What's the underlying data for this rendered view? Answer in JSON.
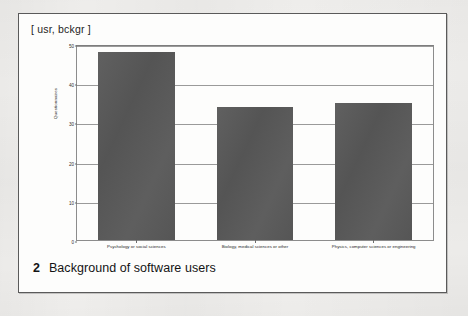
{
  "page": {
    "header_label": "[ usr, bckgr ]"
  },
  "caption": {
    "number": "2",
    "text": "Background of software users"
  },
  "chart_data": {
    "type": "bar",
    "title": "",
    "xlabel": "",
    "ylabel": "Questionnaires",
    "ylim": [
      0,
      50
    ],
    "yticks": [
      0,
      10,
      20,
      30,
      40,
      50
    ],
    "ytick_labels": [
      "0",
      "10",
      "20",
      "30",
      "40",
      "50"
    ],
    "grid": true,
    "legend": "none",
    "bar_color": "#595959",
    "categories": [
      "Psychology or social sciences",
      "Biology, medical sciences or other",
      "Physics, computer sciences or engineering"
    ],
    "values": [
      48,
      34,
      35
    ]
  }
}
